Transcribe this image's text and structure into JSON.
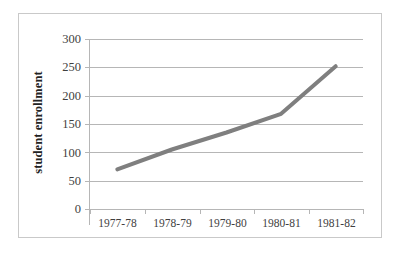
{
  "chart_data": {
    "type": "line",
    "title": "",
    "xlabel": "",
    "ylabel": "student enrollment",
    "categories": [
      "1977-78",
      "1978-79",
      "1979-80",
      "1980-81",
      "1981-82"
    ],
    "values": [
      70,
      105,
      135,
      168,
      252
    ],
    "series": [
      {
        "name": "student enrollment",
        "values": [
          70,
          105,
          135,
          168,
          252
        ]
      }
    ],
    "ylim": [
      0,
      300
    ],
    "y_ticks": [
      0,
      50,
      100,
      150,
      200,
      250,
      300
    ],
    "y_tick_labels": [
      "0",
      "50",
      "100",
      "150",
      "200",
      "250",
      "300"
    ],
    "grid": "horizontal",
    "legend": "none",
    "line_color": "#7f7f7f",
    "line_width": 4,
    "markers": "none",
    "plot_background": "#ffffff",
    "gridline_color": "#b6b6b6",
    "axis_color": "#b6b6b6",
    "tick_label_color": "#3f3f3f",
    "border_color": "#c9c9c9"
  }
}
